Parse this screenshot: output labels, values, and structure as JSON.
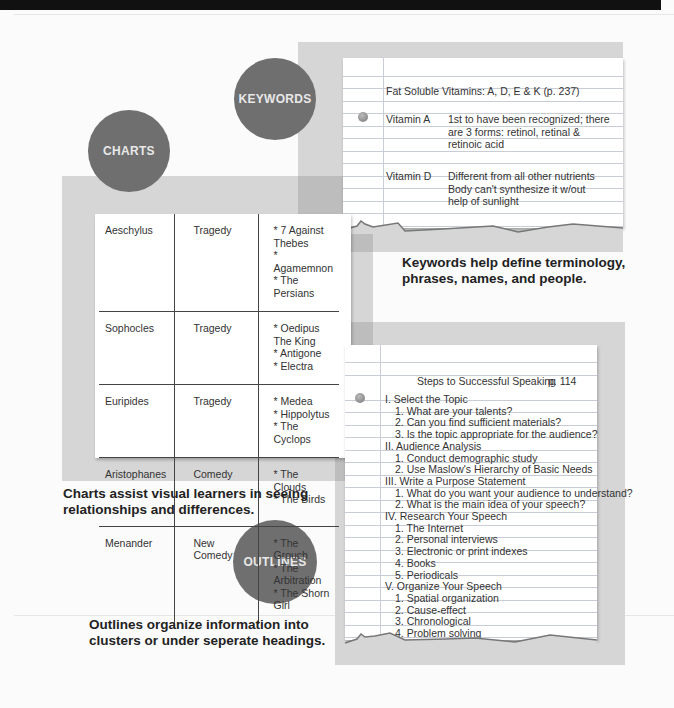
{
  "sections": {
    "keywords": {
      "badge": "KEYWORDS",
      "note": {
        "heading": "Fat Soluble Vitamins: A, D, E & K (p. 237)",
        "entries": [
          {
            "term": "Vitamin A",
            "lines": [
              "1st to have been recognized; there",
              "are 3 forms: retinol, retinal &",
              "retinoic acid"
            ]
          },
          {
            "term": "Vitamin D",
            "lines": [
              "Different from all other nutrients",
              "Body can't synthesize it w/out",
              "help of sunlight"
            ]
          }
        ]
      },
      "caption": [
        "Keywords help define terminology,",
        "phrases, names, and people."
      ]
    },
    "charts": {
      "badge": "CHARTS",
      "table": [
        {
          "author": "Aeschylus",
          "genre": [
            "Tragedy"
          ],
          "works": [
            "* 7 Against Thebes",
            "* Agamemnon",
            "* The Persians"
          ]
        },
        {
          "author": "Sophocles",
          "genre": [
            "Tragedy"
          ],
          "works": [
            "* Oedipus The King",
            "* Antigone",
            "* Electra"
          ]
        },
        {
          "author": "Euripides",
          "genre": [
            "Tragedy"
          ],
          "works": [
            "* Medea",
            "* Hippolytus",
            "* The Cyclops"
          ]
        },
        {
          "author": "Aristophanes",
          "genre": [
            "Comedy"
          ],
          "works": [
            "* The Clouds",
            "* The Birds"
          ]
        },
        {
          "author": "Menander",
          "genre": [
            "New",
            "Comedy"
          ],
          "works": [
            "* The Grouch",
            "* The Arbitration",
            "* The Shorn Girl"
          ]
        }
      ],
      "caption": [
        "Charts assist visual learners in seeing",
        "relationships and differences."
      ]
    },
    "outlines": {
      "badge": "OUTLINES",
      "note": {
        "title": "Steps to Successful Speaking",
        "page": "p. 114",
        "lines": [
          {
            "text": "I. Select the Topic",
            "indent": 0
          },
          {
            "text": "1.  What are your talents?",
            "indent": 1
          },
          {
            "text": "2. Can you find sufficient materials?",
            "indent": 1
          },
          {
            "text": "3. Is the topic appropriate for the audience?",
            "indent": 1
          },
          {
            "text": "II. Audience Analysis",
            "indent": 0
          },
          {
            "text": "1. Conduct demographic study",
            "indent": 1
          },
          {
            "text": "2. Use Maslow's Hierarchy of Basic Needs",
            "indent": 1
          },
          {
            "text": "III. Write a Purpose Statement",
            "indent": 0
          },
          {
            "text": "1. What do you want your audience to understand?",
            "indent": 1
          },
          {
            "text": "2. What is the main idea of your speech?",
            "indent": 1
          },
          {
            "text": "IV. Research Your Speech",
            "indent": 0
          },
          {
            "text": "1. The Internet",
            "indent": 1
          },
          {
            "text": "2. Personal interviews",
            "indent": 1
          },
          {
            "text": "3. Electronic or print indexes",
            "indent": 1
          },
          {
            "text": "4. Books",
            "indent": 1
          },
          {
            "text": "5. Periodicals",
            "indent": 1
          },
          {
            "text": "V. Organize Your Speech",
            "indent": 0
          },
          {
            "text": "1. Spatial organization",
            "indent": 1
          },
          {
            "text": "2. Cause-effect",
            "indent": 1
          },
          {
            "text": "3. Chronological",
            "indent": 1
          },
          {
            "text": "4. Problem solving",
            "indent": 1
          }
        ]
      },
      "caption": [
        "Outlines organize information into",
        "clusters or under seperate headings."
      ]
    }
  },
  "colors": {
    "badge": "#6f6f6f",
    "panel": "#d6d6d6",
    "panel_overlap": "#bdbdbd"
  }
}
